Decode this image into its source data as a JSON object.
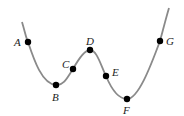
{
  "diagram": {
    "curve_color": "#8a8a8a",
    "point_color": "#000000",
    "points": [
      {
        "label": "A",
        "x": 28,
        "y": 42
      },
      {
        "label": "B",
        "x": 56,
        "y": 85
      },
      {
        "label": "C",
        "x": 73,
        "y": 69
      },
      {
        "label": "D",
        "x": 90,
        "y": 50
      },
      {
        "label": "E",
        "x": 106,
        "y": 76
      },
      {
        "label": "F",
        "x": 127,
        "y": 99
      },
      {
        "label": "G",
        "x": 160,
        "y": 41
      }
    ]
  }
}
